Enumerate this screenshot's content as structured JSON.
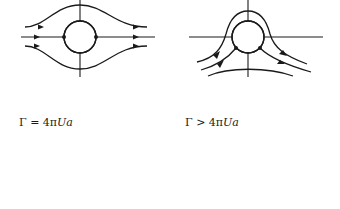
{
  "figure": {
    "panels": [
      {
        "id": "no-circulation",
        "label": "",
        "stagnation_points": "two, on horizontal axis"
      },
      {
        "id": "sub-critical-circulation",
        "label": "",
        "stagnation_points": "two, below horizontal axis on cylinder surface"
      },
      {
        "id": "critical-circulation",
        "label_prefix": "Γ = 4π",
        "label_italic": "Ua",
        "stagnation_points": "one, at bottom of cylinder"
      },
      {
        "id": "super-critical-circulation",
        "label_prefix": "Γ > 4π",
        "label_italic": "Ua",
        "stagnation_points": "one, in flow below cylinder"
      }
    ],
    "colors": {
      "line": "#1a1a1a",
      "background": "#ffffff"
    }
  }
}
